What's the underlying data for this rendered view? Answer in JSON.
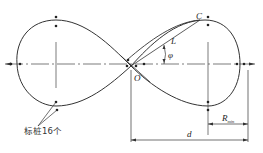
{
  "figure": {
    "type": "figure-eight track layout",
    "labels": {
      "point_c": "C",
      "line_l": "L",
      "angle_phi": "φ",
      "center_o": "O",
      "radius_label": "R",
      "radius_subscript": "min",
      "distance_d": "d",
      "stakes_note": "标桩16个"
    },
    "colors": {
      "line": "#333333",
      "background": "#ffffff"
    }
  }
}
